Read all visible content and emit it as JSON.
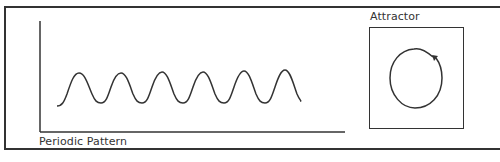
{
  "diagram": {
    "periodic": {
      "label": "Periodic Pattern",
      "cycles": 6
    },
    "attractor": {
      "label": "Attractor",
      "shape": "limit-cycle circle with arrow"
    }
  }
}
